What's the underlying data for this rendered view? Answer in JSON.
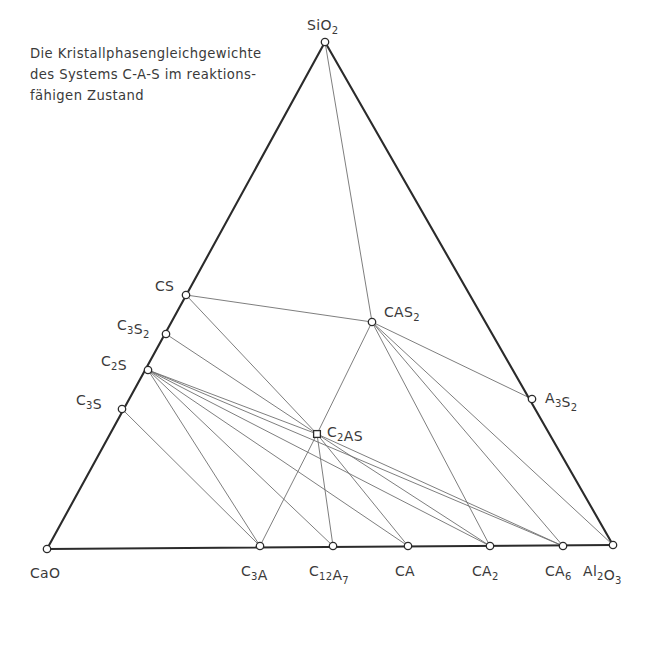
{
  "caption": {
    "text": "Die Kristallphasengleichgewichte\ndes Systems C-A-S im reaktions-\nfähigen Zustand",
    "line1": "Die Kristallphasengleichgewichte",
    "line2": "des Systems C-A-S im reaktions-",
    "line3": "fähigen Zustand"
  },
  "colors": {
    "edge": "#2b2b2b",
    "tieline": "#6f6f6f",
    "text": "#3a3a3a",
    "marker_fill": "#ffffff",
    "background": "#ffffff"
  },
  "chart_data": {
    "type": "scatter",
    "xlabel": "",
    "ylabel": "",
    "diagram_kind": "ternary phase diagram",
    "system": "C-A-S",
    "components": [
      "CaO",
      "Al2O3",
      "SiO2"
    ],
    "vertices": [
      {
        "id": "SiO2",
        "label": "SiO",
        "sub": "2",
        "x": 325,
        "y": 42,
        "label_x": 307,
        "label_y": 30,
        "marker": "circle"
      },
      {
        "id": "CaO",
        "label": "CaO",
        "sub": "",
        "x": 47,
        "y": 549,
        "label_x": 30,
        "label_y": 578,
        "marker": "circle"
      },
      {
        "id": "Al2O3",
        "label": "Al",
        "sub": "2",
        "x": 613,
        "y": 545,
        "label_x": 583,
        "label_y": 576,
        "marker": "circle"
      }
    ],
    "points": [
      {
        "id": "CS",
        "label": "CS",
        "x": 186,
        "y": 295,
        "label_x": 155,
        "label_y": 291,
        "marker": "circle",
        "edge": "CaO-SiO2"
      },
      {
        "id": "C3S2",
        "label": "C3S2",
        "x": 166,
        "y": 334,
        "label_x": 117,
        "label_y": 330,
        "marker": "circle",
        "edge": "CaO-SiO2"
      },
      {
        "id": "C2S",
        "label": "C2S",
        "x": 148,
        "y": 370,
        "label_x": 101,
        "label_y": 366,
        "marker": "circle",
        "edge": "CaO-SiO2"
      },
      {
        "id": "C3S",
        "label": "C3S",
        "x": 122,
        "y": 409,
        "label_x": 76,
        "label_y": 405,
        "marker": "circle",
        "edge": "CaO-SiO2"
      },
      {
        "id": "C3A",
        "label": "C3A",
        "x": 260,
        "y": 546,
        "label_x": 241,
        "label_y": 576,
        "marker": "circle",
        "edge": "CaO-Al2O3"
      },
      {
        "id": "C12A7",
        "label": "C12A7",
        "x": 333,
        "y": 546,
        "label_x": 309,
        "label_y": 576,
        "marker": "circle",
        "edge": "CaO-Al2O3"
      },
      {
        "id": "CA",
        "label": "CA",
        "x": 408,
        "y": 546,
        "label_x": 395,
        "label_y": 576,
        "marker": "circle",
        "edge": "CaO-Al2O3"
      },
      {
        "id": "CA2",
        "label": "CA2",
        "x": 490,
        "y": 546,
        "label_x": 472,
        "label_y": 576,
        "marker": "circle",
        "edge": "CaO-Al2O3"
      },
      {
        "id": "CA6",
        "label": "CA6",
        "x": 563,
        "y": 546,
        "label_x": 545,
        "label_y": 576,
        "marker": "circle",
        "edge": "CaO-Al2O3"
      },
      {
        "id": "A3S2",
        "label": "A3S2",
        "x": 532,
        "y": 399,
        "label_x": 545,
        "label_y": 403,
        "marker": "circle",
        "edge": "SiO2-Al2O3"
      },
      {
        "id": "CAS2",
        "label": "CAS2",
        "x": 372,
        "y": 322,
        "label_x": 384,
        "label_y": 317,
        "marker": "circle",
        "edge": "interior"
      },
      {
        "id": "C2AS",
        "label": "C2AS",
        "x": 317,
        "y": 434,
        "label_x": 327,
        "label_y": 437,
        "marker": "square",
        "edge": "interior"
      }
    ],
    "tie_lines": [
      [
        "SiO2",
        "CAS2"
      ],
      [
        "CS",
        "CAS2"
      ],
      [
        "CS",
        "C2AS"
      ],
      [
        "C3S2",
        "C2AS"
      ],
      [
        "C2S",
        "C2AS"
      ],
      [
        "C2S",
        "C3A"
      ],
      [
        "C2S",
        "C12A7"
      ],
      [
        "C2S",
        "CA"
      ],
      [
        "C2S",
        "CA2"
      ],
      [
        "C2S",
        "CA6"
      ],
      [
        "C3S",
        "C3A"
      ],
      [
        "CAS2",
        "C2AS"
      ],
      [
        "CAS2",
        "A3S2"
      ],
      [
        "CAS2",
        "CA2"
      ],
      [
        "CAS2",
        "CA6"
      ],
      [
        "CAS2",
        "Al2O3"
      ],
      [
        "C2AS",
        "C3A"
      ],
      [
        "C2AS",
        "C12A7"
      ],
      [
        "C2AS",
        "CA"
      ],
      [
        "C2AS",
        "CA2"
      ],
      [
        "C2AS",
        "CA6"
      ]
    ],
    "edges": [
      [
        "SiO2",
        "CaO"
      ],
      [
        "CaO",
        "Al2O3"
      ],
      [
        "Al2O3",
        "SiO2"
      ]
    ],
    "legend": [],
    "grid": false
  }
}
